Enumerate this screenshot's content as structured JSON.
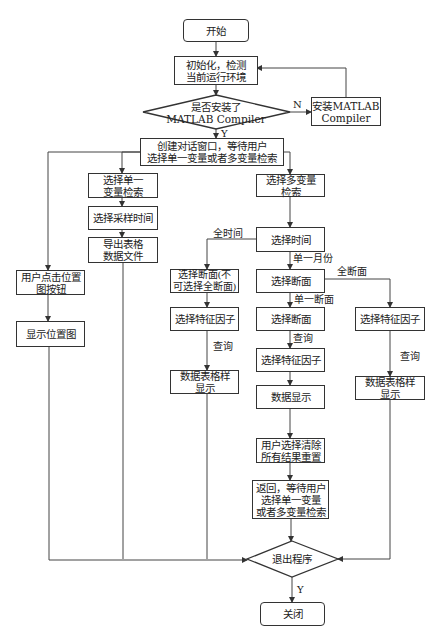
{
  "flowchart": {
    "start": "开始",
    "init": [
      "初始化，检测",
      "当前运行环境"
    ],
    "check_matlab": [
      "是否安装了",
      "MATLAB  Compiler"
    ],
    "install_matlab": [
      "安装MATLAB",
      "Compiler"
    ],
    "create_dialog": [
      "创建对话窗口，等待用户",
      "选择单一变量或者多变量检索"
    ],
    "single_var": [
      "选择单一",
      "变量检索"
    ],
    "select_sample_time": "选择采样时间",
    "export_table": [
      "导出表格",
      "数据文件"
    ],
    "multi_var": [
      "选择多变量",
      "检索"
    ],
    "select_time": "选择时间",
    "click_location": [
      "用户点击位置",
      "图按钮"
    ],
    "show_location": "显示位置图",
    "select_section_partial": [
      "选择断面(不",
      "可选择全断面)"
    ],
    "select_section_a": "选择断面",
    "select_factor_left": "选择特征因子",
    "select_section_b": "选择断面",
    "select_factor_right": "选择特征因子",
    "select_factor_mid": "选择特征因子",
    "table_display_left": [
      "数据表格样",
      "显示"
    ],
    "data_display": "数据显示",
    "table_display_right": [
      "数据表格样",
      "显示"
    ],
    "clear_reset": [
      "用户选择清除",
      "所有结果重置"
    ],
    "return_wait": [
      "返回，等待用户",
      "选择单一变量",
      "或者多变量检索"
    ],
    "exit_program": "退出程序",
    "close": "关闭"
  },
  "edge_labels": {
    "no": "N",
    "yes_top": "Y",
    "all_time": "全时间",
    "single_month": "单一月份",
    "all_section": "全断面",
    "single_section": "单一断面",
    "query_left": "查询",
    "query_mid": "查询",
    "query_right": "查询",
    "yes_bottom": "Y"
  }
}
